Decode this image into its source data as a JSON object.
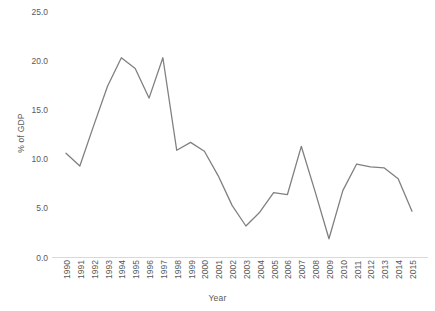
{
  "chart_data": {
    "type": "line",
    "title": "",
    "xlabel": "Year",
    "ylabel": "% of GDP",
    "xlim": [
      1990,
      2015
    ],
    "ylim": [
      0.0,
      25.0
    ],
    "grid": false,
    "legend": false,
    "legend_position": "none",
    "line_color": "#808080",
    "axis_color": "#d9d9d9",
    "tick_label_color": "#595959",
    "ytick_labels": [
      "0.0",
      "5.0",
      "10.0",
      "15.0",
      "20.0",
      "25.0"
    ],
    "ytick_values": [
      0.0,
      5.0,
      10.0,
      15.0,
      20.0,
      25.0
    ],
    "categories": [
      "1990",
      "1991",
      "1992",
      "1993",
      "1994",
      "1995",
      "1996",
      "1997",
      "1998",
      "1999",
      "2000",
      "2001",
      "2002",
      "2003",
      "2004",
      "2005",
      "2006",
      "2007",
      "2008",
      "2009",
      "2010",
      "2011",
      "2012",
      "2013",
      "2014",
      "2015"
    ],
    "x": [
      1990,
      1991,
      1992,
      1993,
      1994,
      1995,
      1996,
      1997,
      1998,
      1999,
      2000,
      2001,
      2002,
      2003,
      2004,
      2005,
      2006,
      2007,
      2008,
      2009,
      2010,
      2011,
      2012,
      2013,
      2014,
      2015
    ],
    "values": [
      10.6,
      9.3,
      13.4,
      17.4,
      20.3,
      19.2,
      16.2,
      20.3,
      10.9,
      11.7,
      10.8,
      8.3,
      5.3,
      3.2,
      4.6,
      6.6,
      6.4,
      11.3,
      6.7,
      1.9,
      6.8,
      9.5,
      9.2,
      9.1,
      8.0,
      4.7
    ]
  }
}
